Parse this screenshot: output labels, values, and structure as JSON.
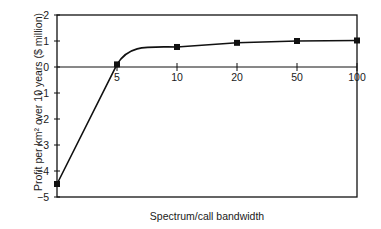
{
  "chart_data": {
    "type": "line",
    "title": "",
    "xlabel": "Spectrum/call bandwidth",
    "ylabel": "Profit per km² over 10 years ($ million)",
    "ylim": [
      -5,
      2
    ],
    "yticks": [
      2,
      1,
      0,
      -1,
      -2,
      -3,
      -4,
      -5
    ],
    "ytick_labels": [
      "2",
      "1",
      "0",
      "−1",
      "−2",
      "−3",
      "−4",
      "−5"
    ],
    "x_tick_labels": [
      "5",
      "10",
      "20",
      "50",
      "100"
    ],
    "x_scale": "categorical (log-like spacing)",
    "grid": false,
    "legend": null,
    "series": [
      {
        "name": "Profit",
        "x": [
          "(left edge)",
          "5",
          "10",
          "20",
          "50",
          "100"
        ],
        "values": [
          -4.5,
          0.1,
          0.77,
          0.93,
          1.0,
          1.02
        ],
        "marker": "square",
        "color": "#111111"
      }
    ]
  },
  "labels": {
    "xlabel": "Spectrum/call bandwidth",
    "ylabel": "Profit per km² over 10 years ($ million)"
  }
}
